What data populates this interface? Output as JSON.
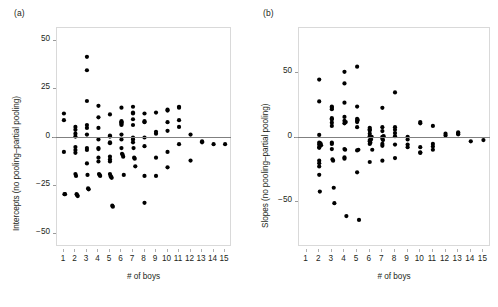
{
  "figure": {
    "panels": [
      {
        "key": "a",
        "label": "(a)",
        "xlabel": "# of boys",
        "ylabel": "Intercepts (no pooling–partial pooling)",
        "ytick_labels": [
          "50",
          "25",
          "0",
          "−25",
          "−50"
        ],
        "xtick_labels": [
          "1",
          "2",
          "3",
          "4",
          "5",
          "6",
          "7",
          "8",
          "9",
          "10",
          "11",
          "12",
          "13",
          "14",
          "15"
        ]
      },
      {
        "key": "b",
        "label": "(b)",
        "xlabel": "# of boys",
        "ylabel": "Slopes (no pooling–partial pooling)",
        "ytick_labels": [
          "50",
          "0",
          "−50"
        ],
        "xtick_labels": [
          "1",
          "2",
          "3",
          "4",
          "5",
          "6",
          "7",
          "8",
          "9",
          "10",
          "11",
          "12",
          "13",
          "14",
          "15"
        ]
      }
    ],
    "colors": {
      "point": "#000000",
      "zero_line": "#808080",
      "frame": "#d9d9d9",
      "text": "#231f20"
    }
  },
  "chart_data": [
    {
      "type": "scatter",
      "panel": "a",
      "title": "(a)",
      "xlabel": "# of boys",
      "ylabel": "Intercepts (no pooling–partial pooling)",
      "xlim": [
        0.4,
        15.6
      ],
      "ylim": [
        -57,
        57
      ],
      "yticks": [
        50,
        25,
        0,
        -25,
        -50
      ],
      "xticks": [
        1,
        2,
        3,
        4,
        5,
        6,
        7,
        8,
        9,
        10,
        11,
        12,
        13,
        14,
        15
      ],
      "grid": false,
      "legend": null,
      "reference_line_y": 0,
      "x": [
        1,
        1,
        1,
        1.05,
        1.1,
        2,
        2,
        2,
        2,
        2,
        2,
        2,
        2,
        2.05,
        2.1,
        2.15,
        2.2,
        3,
        3,
        3,
        3,
        3,
        3,
        3,
        3,
        3,
        3.05,
        3.1,
        3.15,
        4,
        4,
        4,
        4,
        4,
        4,
        4,
        4,
        4.05,
        4.1,
        4.15,
        5,
        5,
        5,
        5,
        5,
        5,
        5,
        5,
        5,
        5.05,
        5.1,
        5.15,
        5.2,
        5.25,
        6,
        6,
        6,
        6,
        6,
        6,
        6,
        6,
        6,
        6.05,
        6.1,
        6.15,
        6.2,
        7,
        7,
        7,
        7,
        7,
        7,
        7,
        7,
        7.05,
        7.1,
        7.15,
        7.2,
        8,
        8,
        8,
        8,
        8,
        8,
        8,
        9,
        9,
        9,
        9,
        9,
        10,
        10,
        10,
        10,
        10,
        10,
        11,
        11,
        11,
        11,
        11,
        12,
        12,
        13,
        13,
        14,
        15
      ],
      "y": [
        12.5,
        9.0,
        -7.5,
        -29.5,
        -29.5,
        5.5,
        4.0,
        2.0,
        0.5,
        -5.0,
        -6.5,
        -8.0,
        -19.0,
        -20.0,
        -29.5,
        -30.0,
        -30.5,
        42.0,
        35.0,
        19.0,
        6.5,
        5.0,
        1.5,
        -5.5,
        -6.5,
        -13.5,
        -19.5,
        -26.5,
        -27.0,
        16.5,
        10.5,
        5.0,
        -1.0,
        -5.5,
        -6.0,
        -10.5,
        -12.5,
        -19.0,
        -19.5,
        -20.0,
        12.0,
        1.0,
        0.5,
        -2.5,
        -3.0,
        -10.0,
        -11.5,
        -12.5,
        -19.0,
        -20.0,
        -20.5,
        -21.0,
        -35.5,
        -36.0,
        15.5,
        8.5,
        8.0,
        7.5,
        7.0,
        6.5,
        1.5,
        -1.0,
        -5.5,
        -8.5,
        -9.0,
        -10.0,
        -19.5,
        16.0,
        13.0,
        12.5,
        9.5,
        6.5,
        0.0,
        -1.0,
        -2.5,
        -5.5,
        -10.5,
        -11.0,
        -15.0,
        12.5,
        8.5,
        8.0,
        0.0,
        -4.5,
        -20.0,
        -34.0,
        13.0,
        3.0,
        2.0,
        -10.5,
        -20.0,
        14.5,
        14.0,
        8.0,
        3.5,
        -7.5,
        -15.5,
        16.0,
        15.5,
        9.0,
        5.5,
        -3.5,
        1.5,
        -12.0,
        -2.0,
        -2.5,
        -3.5,
        -3.5
      ]
    },
    {
      "type": "scatter",
      "panel": "b",
      "title": "(b)",
      "xlabel": "# of boys",
      "ylabel": "Slopes (no pooling–partial pooling)",
      "xlim": [
        0.4,
        15.6
      ],
      "ylim": [
        -85,
        85
      ],
      "yticks": [
        50,
        0,
        -50
      ],
      "xticks": [
        1,
        2,
        3,
        4,
        5,
        6,
        7,
        8,
        9,
        10,
        11,
        12,
        13,
        14,
        15
      ],
      "grid": false,
      "legend": null,
      "reference_line_y": 0,
      "x": [
        2,
        2,
        2,
        2,
        2,
        2,
        2,
        2,
        2,
        2,
        2,
        2.05,
        2.1,
        2.15,
        3,
        3,
        3,
        3,
        3,
        3,
        3,
        3,
        3,
        3,
        3.05,
        3.1,
        3.15,
        3.2,
        4,
        4,
        4,
        4,
        4,
        4,
        4,
        4,
        4,
        4.05,
        4.1,
        4.15,
        5,
        5,
        5,
        5,
        5,
        5,
        5,
        5,
        5.05,
        5.1,
        5.15,
        6,
        6,
        6,
        6,
        6,
        6,
        6,
        6,
        6,
        6.05,
        6.1,
        6.15,
        6.2,
        7,
        7,
        7,
        7,
        7,
        7,
        7,
        7,
        7.05,
        7.1,
        8,
        8,
        8,
        8,
        8,
        8,
        8,
        9,
        9,
        9,
        9,
        10,
        10,
        10,
        10,
        10,
        11,
        11,
        11,
        11,
        12,
        12,
        13,
        13,
        13,
        14,
        15
      ],
      "y": [
        45.0,
        28.0,
        2.0,
        -4.0,
        -5.5,
        -7.5,
        -8.0,
        -18.0,
        -20.0,
        -22.5,
        -29.0,
        -42.0,
        -4.5,
        -6.0,
        24.0,
        23.0,
        22.0,
        15.0,
        14.0,
        11.5,
        9.0,
        -4.0,
        -5.0,
        -9.0,
        -17.0,
        -18.0,
        -39.0,
        -51.0,
        51.0,
        42.0,
        27.0,
        16.0,
        13.0,
        11.0,
        -9.0,
        -15.5,
        -16.5,
        -9.5,
        12.0,
        -61.0,
        55.0,
        24.0,
        14.5,
        13.0,
        12.0,
        8.0,
        -10.0,
        -27.0,
        13.5,
        -9.5,
        -64.0,
        7.5,
        6.5,
        5.5,
        3.0,
        1.0,
        -2.0,
        -3.0,
        -5.0,
        -19.0,
        -4.0,
        -1.5,
        0.5,
        -9.5,
        23.0,
        8.0,
        5.0,
        0.5,
        -1.0,
        -5.0,
        -6.5,
        -18.0,
        -2.0,
        1.0,
        35.0,
        8.0,
        6.0,
        3.5,
        1.0,
        -5.5,
        -16.0,
        0.5,
        -1.5,
        -5.5,
        -7.5,
        12.0,
        11.0,
        -7.5,
        -11.5,
        -12.0,
        9.0,
        -5.0,
        -7.0,
        -9.5,
        3.0,
        1.5,
        4.0,
        3.0,
        2.5,
        -3.0,
        -2.0
      ]
    }
  ]
}
